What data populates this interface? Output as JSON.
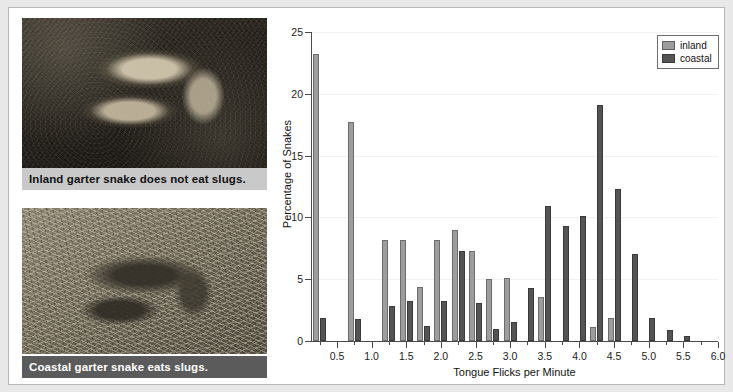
{
  "figure": {
    "photos": [
      {
        "caption": "Inland garter snake does not eat slugs.",
        "style": "light",
        "alt_name": "inland-garter-snake-photo"
      },
      {
        "caption": "Coastal garter snake eats slugs.",
        "style": "dark",
        "alt_name": "coastal-garter-snake-photo"
      }
    ]
  },
  "chart_data": {
    "type": "bar",
    "title": "",
    "xlabel": "Tongue Flicks per Minute",
    "ylabel": "Percentage of Snakes",
    "xlim": [
      0.125,
      6.0
    ],
    "ylim": [
      0,
      25
    ],
    "xticks": [
      0.5,
      1.0,
      1.5,
      2.0,
      2.5,
      3.0,
      3.5,
      4.0,
      4.5,
      5.0,
      5.5,
      6.0
    ],
    "xtick_labels": [
      "0.5",
      "1.0",
      "1.5",
      "2.0",
      "2.5",
      "3.0",
      "3.5",
      "4.0",
      "4.5",
      "5.0",
      "5.5",
      "6.0"
    ],
    "xtick_minor_step": 0.25,
    "yticks": [
      0,
      5,
      10,
      15,
      20,
      25
    ],
    "ytick_labels": [
      "0",
      "5",
      "10",
      "15",
      "20",
      "25"
    ],
    "grid": "horizontal",
    "legend_position": "top-right",
    "legend": [
      "inland",
      "coastal"
    ],
    "colors": {
      "inland": "#9d9d9d",
      "coastal": "#545454",
      "axis": "#4a4a4a",
      "grid": "#f1f1f1"
    },
    "bin_width": 0.25,
    "bins": [
      0.25,
      0.5,
      0.75,
      1.0,
      1.25,
      1.5,
      1.75,
      2.0,
      2.25,
      2.5,
      2.75,
      3.0,
      3.25,
      3.5,
      3.75,
      4.0,
      4.25,
      4.5,
      4.75,
      5.0,
      5.25,
      5.5
    ],
    "series": [
      {
        "name": "inland",
        "values": [
          23.2,
          0,
          17.7,
          0,
          8.2,
          8.2,
          4.4,
          8.2,
          9.0,
          7.3,
          5.0,
          5.1,
          0,
          3.6,
          0,
          0,
          1.1,
          1.9,
          0,
          0,
          0,
          0
        ]
      },
      {
        "name": "coastal",
        "values": [
          1.9,
          0,
          1.8,
          0,
          2.8,
          3.2,
          1.2,
          3.2,
          7.3,
          3.1,
          1.0,
          1.5,
          4.3,
          10.9,
          9.3,
          10.1,
          19.1,
          12.3,
          7.0,
          1.9,
          0.9,
          0.4
        ]
      }
    ]
  }
}
